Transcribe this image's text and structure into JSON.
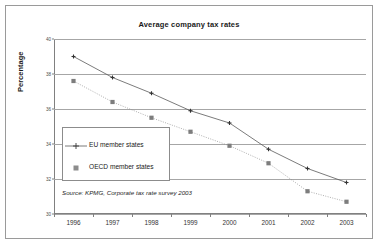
{
  "figure": {
    "title": "Average company tax rates",
    "source_note": "Source: KPMG, Corporate tax rate survey 2003",
    "border_color": "#9a9a9a",
    "background_color": "#ffffff"
  },
  "chart_data": {
    "type": "line",
    "title": "Average company tax rates",
    "xlabel": "",
    "ylabel": "Percentage",
    "categories": [
      "1996",
      "1997",
      "1998",
      "1999",
      "2000",
      "2001",
      "2002",
      "2003"
    ],
    "x": [
      1996,
      1997,
      1998,
      1999,
      2000,
      2001,
      2002,
      2003
    ],
    "ylim": [
      30,
      40
    ],
    "yticks": [
      30,
      32,
      34,
      36,
      38,
      40
    ],
    "ytick_labels": [
      "30",
      "32",
      "34",
      "36",
      "38",
      "40"
    ],
    "grid": "horizontal",
    "legend_position": "inside-left",
    "series": [
      {
        "name": "EU member states",
        "marker": "cross",
        "line_style": "solid",
        "color": "#595959",
        "values": [
          39.0,
          37.8,
          36.9,
          35.9,
          35.2,
          33.7,
          32.6,
          31.8
        ]
      },
      {
        "name": "OECD member states",
        "marker": "square",
        "line_style": "dotted",
        "color": "#8c8c8c",
        "values": [
          37.6,
          36.4,
          35.5,
          34.7,
          33.9,
          32.9,
          31.3,
          30.7
        ]
      }
    ],
    "annotations": [
      "Source: KPMG, Corporate tax rate survey 2003"
    ]
  },
  "legend": {
    "items": [
      {
        "label": "EU member states"
      },
      {
        "label": "OECD member states"
      }
    ]
  }
}
